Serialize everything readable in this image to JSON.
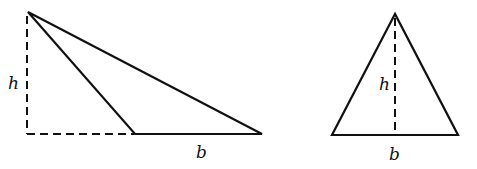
{
  "figures": [
    {
      "id": "obtuse-triangle",
      "height_label": "h",
      "base_label": "b"
    },
    {
      "id": "acute-triangle",
      "height_label": "h",
      "base_label": "b"
    }
  ],
  "colors": {
    "stroke": "#111111",
    "background": "#ffffff"
  }
}
